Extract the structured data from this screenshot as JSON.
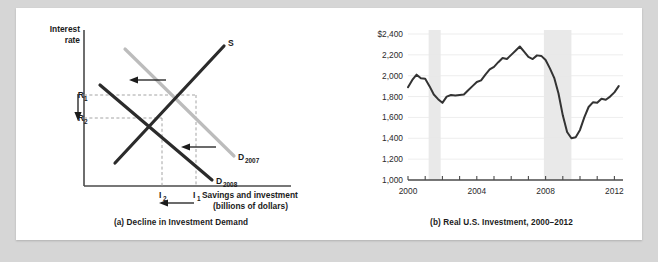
{
  "figure": {
    "panel_a": {
      "caption": "(a) Decline in Investment Demand",
      "y_axis_label_line1": "Interest",
      "y_axis_label_line2": "rate",
      "x_axis_label_line1": "Savings and investment",
      "x_axis_label_line2": "(billions of dollars)",
      "supply_label": "S",
      "demand_2007_label": "D",
      "demand_2007_sub": "2007",
      "demand_2008_label": "D",
      "demand_2008_sub": "2008",
      "rate_high_label": "R",
      "rate_high_sub": "1",
      "rate_low_label": "R",
      "rate_low_sub": "2",
      "invest_high_label": "I",
      "invest_high_sub": "1",
      "invest_low_label": "I",
      "invest_low_sub": "2",
      "colors": {
        "supply": "#2b2b2b",
        "demand_2007": "#bcbcbc",
        "demand_2008": "#2b2b2b",
        "axis": "#4a4a4a",
        "guide": "#9a9a9a"
      }
    },
    "panel_b": {
      "caption": "(b) Real U.S. Investment, 2000–2012"
    }
  },
  "chart_data": {
    "type": "line",
    "title": "(b) Real U.S. Investment, 2000–2012",
    "xlabel": "",
    "ylabel": "",
    "ylim": [
      1000,
      2400
    ],
    "xlim": [
      2000,
      2012.5
    ],
    "grid": true,
    "legend": "none",
    "y_ticks": [
      1000,
      1200,
      1400,
      1600,
      1800,
      2000,
      2200,
      2400
    ],
    "y_tick_labels": [
      "1,000",
      "1,200",
      "1,400",
      "1,600",
      "1,800",
      "2,000",
      "2,200",
      "$2,400"
    ],
    "x_ticks": [
      2000,
      2001,
      2002,
      2003,
      2004,
      2005,
      2006,
      2007,
      2008,
      2009,
      2010,
      2011,
      2012
    ],
    "x_tick_labels": [
      "2000",
      "",
      "",
      "",
      "2004",
      "",
      "",
      "",
      "2008",
      "",
      "",
      "",
      "2012"
    ],
    "recession_bands": [
      {
        "start": 2001.2,
        "end": 2001.9
      },
      {
        "start": 2007.9,
        "end": 2009.5
      }
    ],
    "series": [
      {
        "name": "Real U.S. Investment (billions of dollars)",
        "color": "#333333",
        "x": [
          2000.0,
          2000.25,
          2000.5,
          2000.75,
          2001.0,
          2001.25,
          2001.5,
          2001.75,
          2002.0,
          2002.25,
          2002.5,
          2002.75,
          2003.0,
          2003.25,
          2003.5,
          2003.75,
          2004.0,
          2004.25,
          2004.5,
          2004.75,
          2005.0,
          2005.25,
          2005.5,
          2005.75,
          2006.0,
          2006.25,
          2006.5,
          2006.75,
          2007.0,
          2007.25,
          2007.5,
          2007.75,
          2008.0,
          2008.25,
          2008.5,
          2008.75,
          2009.0,
          2009.25,
          2009.5,
          2009.75,
          2010.0,
          2010.25,
          2010.5,
          2010.75,
          2011.0,
          2011.25,
          2011.5,
          2011.75,
          2012.0,
          2012.25
        ],
        "values": [
          1890,
          1960,
          2010,
          1975,
          1970,
          1900,
          1820,
          1775,
          1740,
          1800,
          1815,
          1810,
          1815,
          1820,
          1860,
          1900,
          1940,
          1955,
          2010,
          2060,
          2085,
          2130,
          2170,
          2160,
          2200,
          2240,
          2280,
          2230,
          2180,
          2160,
          2195,
          2190,
          2150,
          2070,
          1980,
          1830,
          1620,
          1460,
          1400,
          1410,
          1480,
          1600,
          1700,
          1745,
          1740,
          1780,
          1770,
          1800,
          1840,
          1900
        ]
      }
    ]
  }
}
